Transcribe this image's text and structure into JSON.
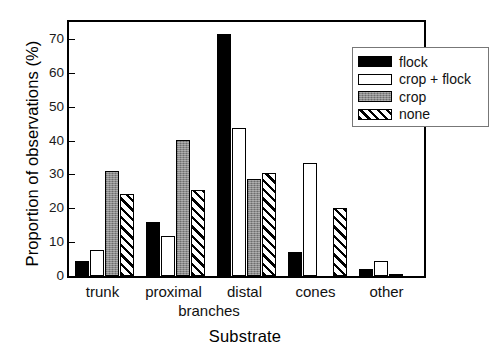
{
  "chart_data": {
    "type": "bar",
    "title": "",
    "xlabel": "Substrate",
    "ylabel": "Proportion of observations (%)",
    "categories": [
      "trunk",
      "proximal",
      "distal",
      "cones",
      "other"
    ],
    "category_sublabel": "branches",
    "ylim": [
      0,
      75
    ],
    "yticks": [
      0,
      10,
      20,
      30,
      40,
      50,
      60,
      70
    ],
    "ytick_labels": [
      "0",
      "10",
      "20",
      "30",
      "40",
      "50",
      "60",
      "70"
    ],
    "grid": false,
    "legend_position": "top-right",
    "series": [
      {
        "name": "flock",
        "fill": "solid-black",
        "color": "#000000",
        "values": [
          4.5,
          16.0,
          71.5,
          7.0,
          2.0
        ]
      },
      {
        "name": "crop + flock",
        "fill": "open-white",
        "color": "#ffffff",
        "values": [
          7.7,
          11.7,
          43.7,
          33.5,
          4.3
        ]
      },
      {
        "name": "crop",
        "fill": "solid-gray",
        "color": "#8a8a8a",
        "values": [
          31.0,
          40.3,
          28.7,
          0.0,
          0.7
        ]
      },
      {
        "name": "none",
        "fill": "diagonal-hatch",
        "color": "#ffffff",
        "values": [
          24.3,
          25.3,
          30.3,
          20.0,
          0.0
        ]
      }
    ]
  },
  "legend": {
    "items": [
      {
        "label": "flock"
      },
      {
        "label": "crop + flock"
      },
      {
        "label": "crop"
      },
      {
        "label": "none"
      }
    ]
  }
}
